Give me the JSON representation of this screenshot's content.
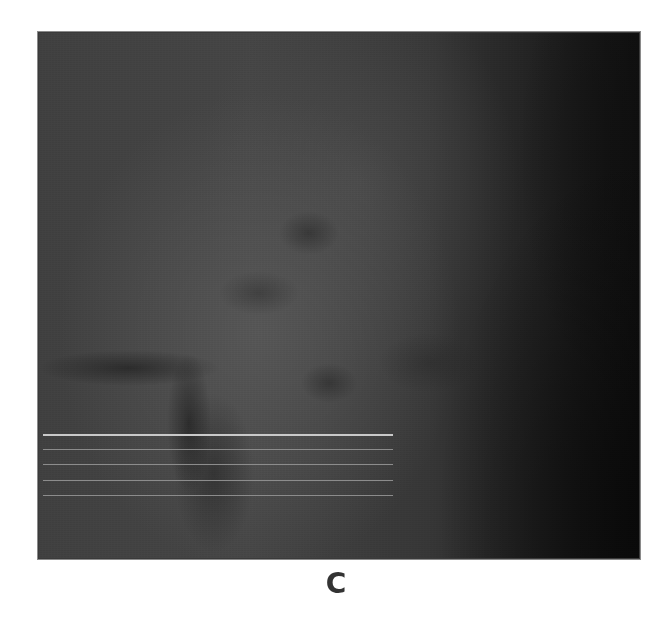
{
  "figure": {
    "panel_label": "C",
    "image_description": "Grayscale retinal (fundus/SLO) image with horizontal scan lines",
    "scan_lines": [
      {
        "id": "line-1",
        "y": 402,
        "x_start": 5,
        "x_end": 355,
        "style": "primary",
        "color": "#c9c9c9"
      },
      {
        "id": "line-2",
        "y": 417,
        "x_start": 5,
        "x_end": 355,
        "style": "secondary",
        "color": "#8c8c8c"
      },
      {
        "id": "line-3",
        "y": 432,
        "x_start": 5,
        "x_end": 355,
        "style": "secondary",
        "color": "#8c8c8c"
      },
      {
        "id": "line-4",
        "y": 448,
        "x_start": 5,
        "x_end": 355,
        "style": "secondary",
        "color": "#8c8c8c"
      },
      {
        "id": "line-5",
        "y": 463,
        "x_start": 5,
        "x_end": 355,
        "style": "secondary",
        "color": "#8c8c8c"
      }
    ],
    "colors": {
      "frame_border": "#8a8a8a",
      "label_text": "#333333",
      "background": "#ffffff"
    }
  }
}
